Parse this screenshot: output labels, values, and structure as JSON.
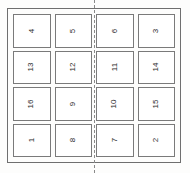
{
  "sheet": {
    "title": "Numbered cell layout sheet",
    "orientation": "landscape",
    "text_rotation_degrees": -90,
    "divider": {
      "name": "vertical-dashed-divider",
      "style": "dashed",
      "orientation": "vertical",
      "position": "between-column-2-and-column-3",
      "color": "#8a8a8a"
    },
    "border_color": "#6f6f6f",
    "cell_border_color": "#7a7a7a",
    "background_color": "#fdfdfc",
    "text_color": "#2b2b2b"
  },
  "grid": {
    "columns": 4,
    "rows": 4,
    "cells": [
      {
        "row": 1,
        "col": 1,
        "label": "4"
      },
      {
        "row": 1,
        "col": 2,
        "label": "5"
      },
      {
        "row": 1,
        "col": 3,
        "label": "6"
      },
      {
        "row": 1,
        "col": 4,
        "label": "3"
      },
      {
        "row": 2,
        "col": 1,
        "label": "13"
      },
      {
        "row": 2,
        "col": 2,
        "label": "12"
      },
      {
        "row": 2,
        "col": 3,
        "label": "11"
      },
      {
        "row": 2,
        "col": 4,
        "label": "14"
      },
      {
        "row": 3,
        "col": 1,
        "label": "16"
      },
      {
        "row": 3,
        "col": 2,
        "label": "9"
      },
      {
        "row": 3,
        "col": 3,
        "label": "10"
      },
      {
        "row": 3,
        "col": 4,
        "label": "15"
      },
      {
        "row": 4,
        "col": 1,
        "label": "1"
      },
      {
        "row": 4,
        "col": 2,
        "label": "8"
      },
      {
        "row": 4,
        "col": 3,
        "label": "7"
      },
      {
        "row": 4,
        "col": 4,
        "label": "2"
      }
    ]
  }
}
